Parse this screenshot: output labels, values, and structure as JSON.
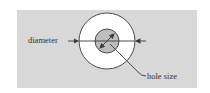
{
  "diagram": {
    "labels": {
      "diameter": "diameter",
      "hole_size": "hole size"
    },
    "colors": {
      "panel": "#d8d8d8",
      "outer_circle_fill": "#ffffff",
      "inner_circle_fill": "#bdbdbd",
      "stroke": "#3a3a3a"
    },
    "shapes": {
      "outer_circle": {
        "cx": 107,
        "cy": 41,
        "r": 28
      },
      "inner_circle": {
        "cx": 107,
        "cy": 41,
        "r": 12
      }
    }
  }
}
